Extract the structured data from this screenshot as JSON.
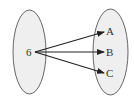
{
  "diagram": {
    "type": "mapping",
    "domain_set": {
      "elements": [
        "6"
      ]
    },
    "codomain_set": {
      "elements": [
        "A",
        "B",
        "C"
      ]
    },
    "arrows": [
      {
        "from": "6",
        "to": "A"
      },
      {
        "from": "6",
        "to": "B"
      },
      {
        "from": "6",
        "to": "C"
      }
    ],
    "colors": {
      "set_fill": "#efefef",
      "set_stroke": "#666666",
      "arrow": "#222222",
      "text": "#333333"
    }
  }
}
